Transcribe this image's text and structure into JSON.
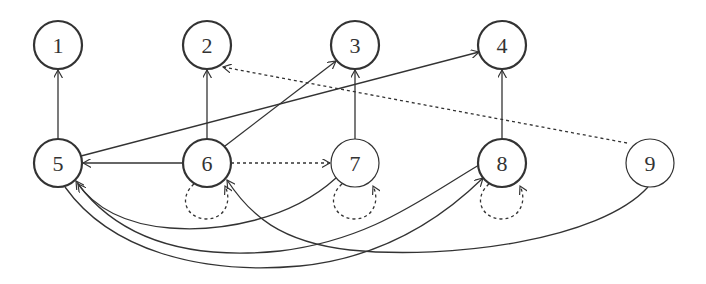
{
  "diagram": {
    "type": "directed-graph",
    "colors": {
      "stroke": "#333333",
      "background": "#ffffff"
    },
    "nodes": [
      {
        "id": "1",
        "label": "1",
        "x": 58,
        "y": 45,
        "bold": true
      },
      {
        "id": "2",
        "label": "2",
        "x": 207,
        "y": 45,
        "bold": true
      },
      {
        "id": "3",
        "label": "3",
        "x": 355,
        "y": 45,
        "bold": true
      },
      {
        "id": "4",
        "label": "4",
        "x": 502,
        "y": 45,
        "bold": true
      },
      {
        "id": "5",
        "label": "5",
        "x": 58,
        "y": 163,
        "bold": true
      },
      {
        "id": "6",
        "label": "6",
        "x": 207,
        "y": 163,
        "bold": true
      },
      {
        "id": "7",
        "label": "7",
        "x": 355,
        "y": 163,
        "bold": false
      },
      {
        "id": "8",
        "label": "8",
        "x": 502,
        "y": 163,
        "bold": true
      },
      {
        "id": "9",
        "label": "9",
        "x": 650,
        "y": 163,
        "bold": false
      }
    ],
    "edges": [
      {
        "from": "5",
        "to": "1",
        "style": "solid"
      },
      {
        "from": "6",
        "to": "2",
        "style": "solid"
      },
      {
        "from": "7",
        "to": "3",
        "style": "solid"
      },
      {
        "from": "8",
        "to": "4",
        "style": "solid"
      },
      {
        "from": "5",
        "to": "4",
        "style": "solid"
      },
      {
        "from": "6",
        "to": "3",
        "style": "solid"
      },
      {
        "from": "6",
        "to": "5",
        "style": "solid"
      },
      {
        "from": "6",
        "to": "7",
        "style": "dashed"
      },
      {
        "from": "9",
        "to": "2",
        "style": "dashed"
      },
      {
        "from": "6",
        "to": "6",
        "style": "dashed"
      },
      {
        "from": "7",
        "to": "7",
        "style": "dashed"
      },
      {
        "from": "8",
        "to": "8",
        "style": "dashed"
      },
      {
        "from": "7",
        "to": "5",
        "style": "solid"
      },
      {
        "from": "8",
        "to": "5",
        "style": "solid"
      },
      {
        "from": "5",
        "to": "8",
        "style": "solid"
      },
      {
        "from": "9",
        "to": "6",
        "style": "solid"
      }
    ]
  }
}
